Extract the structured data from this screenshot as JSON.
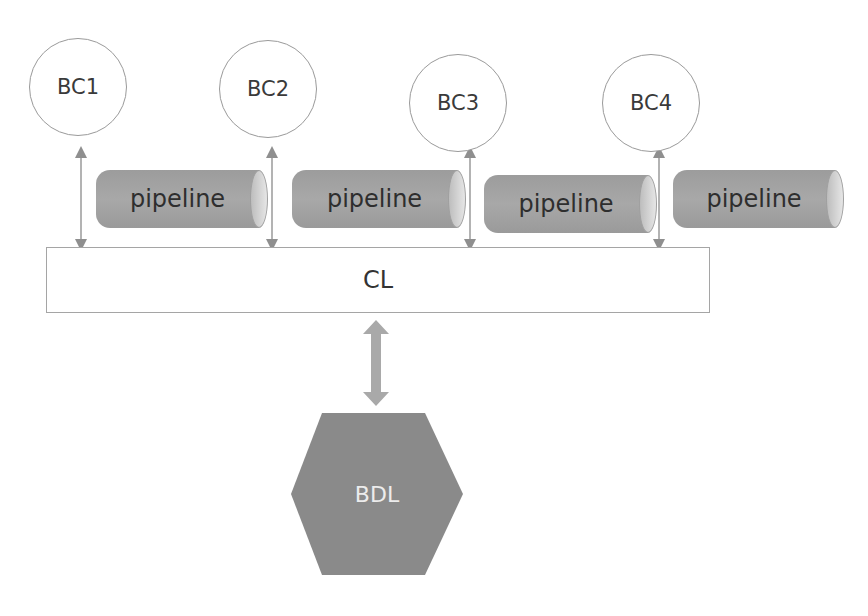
{
  "diagram": {
    "bounded_contexts": [
      {
        "label": "BC1"
      },
      {
        "label": "BC2"
      },
      {
        "label": "BC3"
      },
      {
        "label": "BC4"
      }
    ],
    "pipelines": [
      {
        "label": "pipeline"
      },
      {
        "label": "pipeline"
      },
      {
        "label": "pipeline"
      },
      {
        "label": "pipeline"
      }
    ],
    "common_layer": {
      "label": "CL"
    },
    "data_layer": {
      "label": "BDL"
    },
    "colors": {
      "circle_border": "#9a9a9a",
      "pipeline_fill": "#a3a3a3",
      "arrow": "#999999",
      "bdl_fill": "#8a8a8a",
      "bdl_text": "#ececec"
    }
  }
}
